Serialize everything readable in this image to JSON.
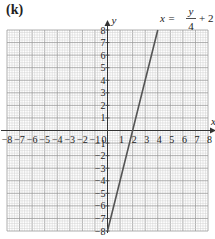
{
  "panel_label": "(k)",
  "chart_data": {
    "type": "line",
    "title": "",
    "equation_label": "x = y/4 + 2",
    "equation_parts": {
      "lhs": "x =",
      "numerator": "y",
      "denominator": "4",
      "rest": "+ 2"
    },
    "xlabel": "x",
    "ylabel": "y",
    "xlim": [
      -8,
      8
    ],
    "ylim": [
      -8,
      8
    ],
    "grid": true,
    "minor_divisions_per_unit": 5,
    "x_ticks": [
      -8,
      -7,
      -6,
      -5,
      -4,
      -3,
      -2,
      -1,
      0,
      1,
      2,
      3,
      4,
      5,
      6,
      7,
      8
    ],
    "y_ticks": [
      -8,
      -7,
      -6,
      -5,
      -4,
      -3,
      -2,
      -1,
      1,
      2,
      3,
      4,
      5,
      6,
      7,
      8
    ],
    "series": [
      {
        "name": "x = y/4 + 2",
        "points": [
          [
            0,
            -8
          ],
          [
            2,
            0
          ],
          [
            4,
            8
          ]
        ],
        "color": "#555555"
      }
    ],
    "colors": {
      "grid_minor": "#d0d0d0",
      "grid_major": "#9a9a9a",
      "axis": "#333333",
      "line": "#555555"
    }
  }
}
